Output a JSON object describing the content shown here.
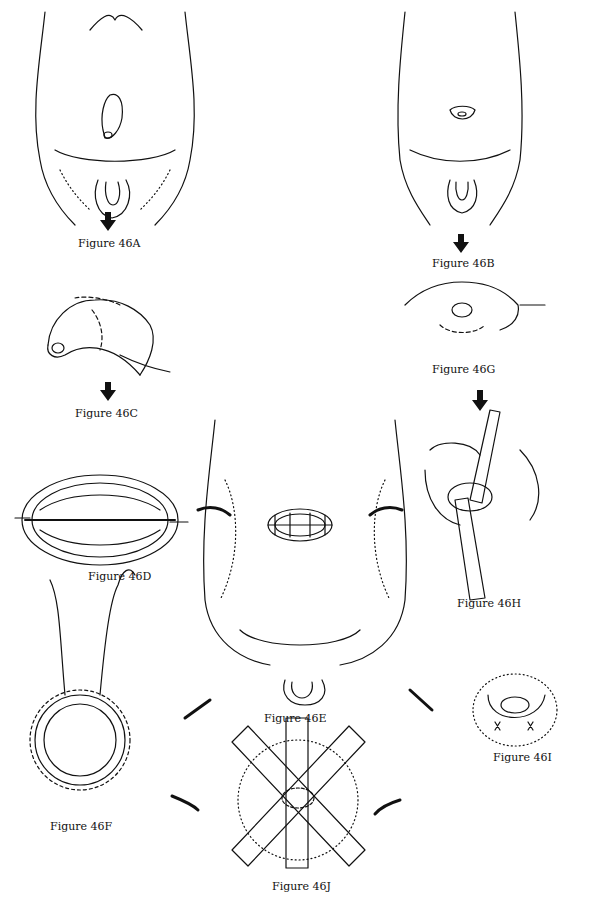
{
  "figures": {
    "A": {
      "label": "Figure 46A"
    },
    "B": {
      "label": "Figure 46B"
    },
    "C": {
      "label": "Figure 46C"
    },
    "D": {
      "label": "Figure 46D"
    },
    "E": {
      "label": "Figure 46E"
    },
    "F": {
      "label": "Figure 46F"
    },
    "G": {
      "label": "Figure 46G"
    },
    "H": {
      "label": "Figure 46H"
    },
    "I": {
      "label": "Figure 46I"
    },
    "J": {
      "label": "Figure 46J"
    }
  },
  "colors": {
    "ink": "#111111",
    "paper": "#ffffff"
  }
}
